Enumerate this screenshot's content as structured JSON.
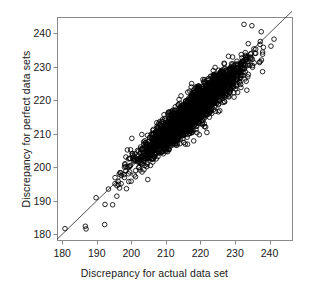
{
  "chart_data": {
    "type": "scatter",
    "title": "",
    "xlabel": "Discrepancy for actual data set",
    "ylabel": "Discrepancy for perfect data sets",
    "xlim": [
      178.5,
      246.5
    ],
    "ylim": [
      178.3,
      244.8
    ],
    "xticks": [
      180,
      190,
      200,
      210,
      220,
      230,
      240
    ],
    "yticks": [
      180,
      190,
      200,
      210,
      220,
      230,
      240
    ],
    "xticklabels": [
      "180",
      "190",
      "200",
      "210",
      "220",
      "230",
      "240"
    ],
    "yticklabels": [
      "180",
      "190",
      "200",
      "210",
      "220",
      "230",
      "240"
    ],
    "grid": false,
    "legend": null,
    "marker": "open-circle",
    "marker_size_px": 4.6,
    "marker_color": "#000000",
    "marker_fill": "none",
    "n_points": 2600,
    "reference_line": {
      "type": "identity",
      "equation": "y = x",
      "from": [
        178.5,
        178.5
      ],
      "to": [
        246.5,
        246.5
      ],
      "color": "#222222",
      "width_px": 0.8
    },
    "cluster": {
      "description": "Elongated positively-correlated point cloud along the identity line",
      "x_mean": 217.5,
      "y_mean": 216.5,
      "x_sd": 7.2,
      "y_sd": 7.0,
      "correlation": 0.93,
      "x_range": [
        191.0,
        241.5
      ],
      "y_range": [
        182.0,
        242.5
      ],
      "dense_core_x": [
        208,
        231
      ],
      "dense_core_y": [
        204,
        232
      ]
    },
    "outliers": [
      [
        180.8,
        181.7
      ],
      [
        186.7,
        182.4
      ],
      [
        186.9,
        181.6
      ],
      [
        192.3,
        182.9
      ],
      [
        189.8,
        190.9
      ],
      [
        192.4,
        188.9
      ],
      [
        194.6,
        188.8
      ],
      [
        193.4,
        193.5
      ],
      [
        196.6,
        193.8
      ],
      [
        198.6,
        193.6
      ],
      [
        195.3,
        196.9
      ],
      [
        197.9,
        197.8
      ],
      [
        241.3,
        238.2
      ],
      [
        238.0,
        233.7
      ],
      [
        237.6,
        240.4
      ],
      [
        234.9,
        242.2
      ],
      [
        232.6,
        242.6
      ]
    ],
    "axes_color": "#8a8a8a",
    "text_color": "#1a1a1a",
    "background": "#ffffff"
  },
  "figure": {
    "frame": {
      "left": 57,
      "top": 17,
      "right": 292,
      "bottom": 240
    }
  }
}
